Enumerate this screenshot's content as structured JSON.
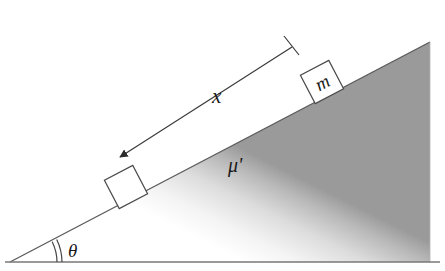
{
  "figure": {
    "background_color": "#ffffff",
    "width": 445,
    "height": 271
  },
  "incline": {
    "name": "inclined-plane-wedge",
    "apex_top": [
      430,
      42
    ],
    "apex_bottom_right": [
      430,
      262
    ],
    "apex_bottom_left": [
      10,
      262
    ],
    "surface_stroke": "#555555",
    "fill_dark": "#9a9a9a",
    "fill_light": "#ffffff",
    "angle_degrees": 27
  },
  "ground": {
    "name": "ground-line",
    "stroke": "#777777",
    "y": 262,
    "x_start": 5,
    "x_end": 440
  },
  "angle_marker": {
    "label": "θ",
    "arc_count": 2,
    "stroke": "#444444"
  },
  "blocks": [
    {
      "id": "upper-block",
      "label": "m",
      "has_label": true,
      "stroke": "#4a4a4a",
      "fill": "#ffffff"
    },
    {
      "id": "lower-block",
      "label": "",
      "has_label": false,
      "stroke": "#4a4a4a",
      "fill": "#ffffff"
    }
  ],
  "dimension": {
    "name": "distance-dimension",
    "label": "x",
    "stroke": "#3a3a3a",
    "arrow_end": "left",
    "tick_end": "right"
  },
  "friction": {
    "name": "friction-coefficient",
    "label": "μ'"
  }
}
